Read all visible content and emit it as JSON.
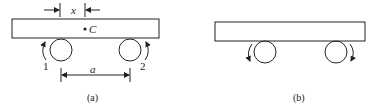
{
  "figure_a": {
    "caption": "(a)",
    "dim_x_label": "x",
    "center_label": "C",
    "roller_1_label": "1",
    "roller_2_label": "2",
    "dim_a_label": "a"
  },
  "figure_b": {
    "caption": "(b)"
  },
  "colors": {
    "stroke": "#222222",
    "background": "#ffffff"
  }
}
